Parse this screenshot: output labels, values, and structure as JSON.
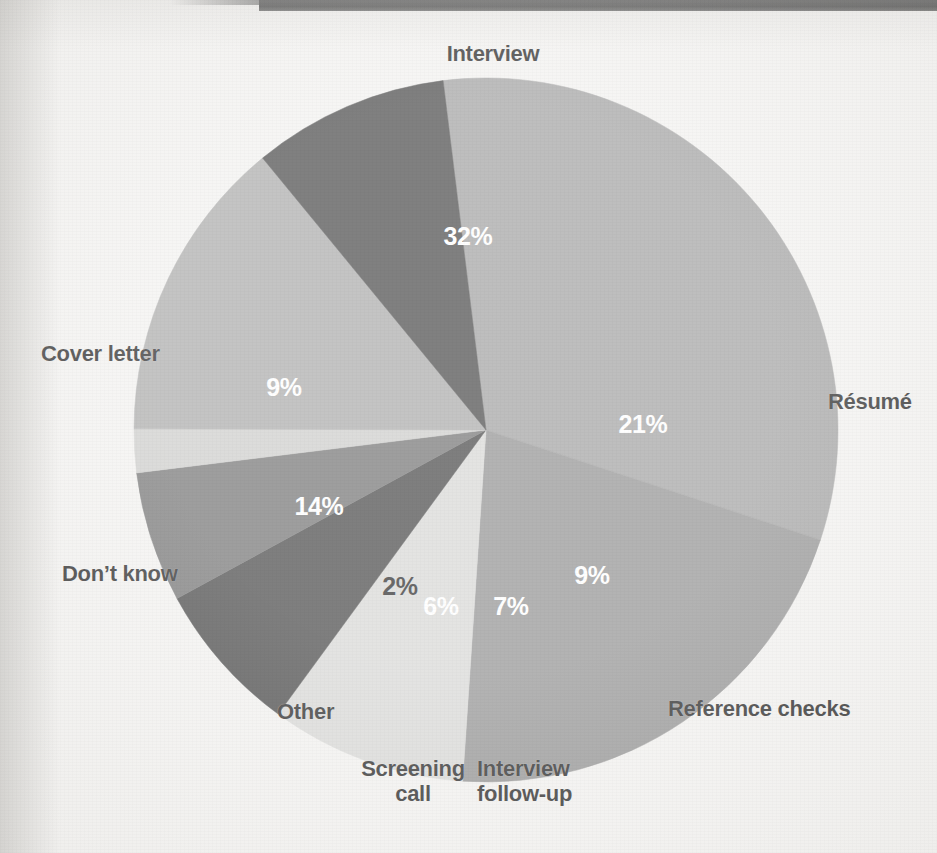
{
  "page": {
    "background_color": "#f2f1ef",
    "top_bar_color": "#434343"
  },
  "chart_data": {
    "type": "pie",
    "title": "",
    "subtitle": "",
    "xlabel": "",
    "ylabel": "",
    "legend_position": "none",
    "grid": false,
    "units": "percent",
    "total": 100,
    "start_angle_deg": -7,
    "direction": "clockwise",
    "categories": [
      "Interview",
      "Résumé",
      "Reference checks",
      "Interview follow-up",
      "Screening call",
      "Other",
      "Don't know",
      "Cover letter"
    ],
    "values": [
      32,
      21,
      9,
      7,
      6,
      2,
      14,
      9
    ],
    "value_labels": [
      "32%",
      "21%",
      "9%",
      "7%",
      "6%",
      "2%",
      "14%",
      "9%"
    ],
    "colors": [
      "#9b9b9b",
      "#8b8b8b",
      "#d5d5d3",
      "#3a3a3a",
      "#6a6a6a",
      "#c9c9c7",
      "#a5a5a4",
      "#3c3c3c"
    ],
    "label_text_colors": [
      "#ffffff",
      "#ffffff",
      "#ffffff",
      "#ffffff",
      "#ffffff",
      "#1a1a1a",
      "#ffffff",
      "#ffffff"
    ],
    "slices": [
      {
        "name": "Interview",
        "value": 32,
        "label": "32%",
        "color": "#9b9b9b",
        "text_color": "#ffffff",
        "label_x": 468,
        "label_y": 238,
        "anchor": "middle"
      },
      {
        "name": "Résumé",
        "value": 21,
        "label": "21%",
        "color": "#8b8b8b",
        "text_color": "#ffffff",
        "label_x": 643,
        "label_y": 426,
        "anchor": "middle"
      },
      {
        "name": "Reference checks",
        "value": 9,
        "label": "9%",
        "color": "#d5d5d3",
        "text_color": "#ffffff",
        "label_x": 592,
        "label_y": 577,
        "anchor": "middle"
      },
      {
        "name": "Interview follow-up",
        "value": 7,
        "label": "7%",
        "color": "#3a3a3a",
        "text_color": "#ffffff",
        "label_x": 511,
        "label_y": 608,
        "anchor": "middle"
      },
      {
        "name": "Screening call",
        "value": 6,
        "label": "6%",
        "color": "#6a6a6a",
        "text_color": "#ffffff",
        "label_x": 441,
        "label_y": 608,
        "anchor": "middle"
      },
      {
        "name": "Other",
        "value": 2,
        "label": "2%",
        "color": "#c9c9c7",
        "text_color": "#1a1a1a",
        "label_x": 400,
        "label_y": 588,
        "anchor": "middle"
      },
      {
        "name": "Don't know",
        "value": 14,
        "label": "14%",
        "color": "#a5a5a4",
        "text_color": "#ffffff",
        "label_x": 319,
        "label_y": 508,
        "anchor": "middle"
      },
      {
        "name": "Cover letter",
        "value": 9,
        "label": "9%",
        "color": "#3c3c3c",
        "text_color": "#ffffff",
        "label_x": 284,
        "label_y": 389,
        "anchor": "middle"
      }
    ],
    "category_labels": [
      {
        "name": "Interview",
        "text": "Interview",
        "x": 418,
        "y": 42,
        "align": "center",
        "width": 150
      },
      {
        "name": "Résumé",
        "text": "Résumé",
        "x": 828,
        "y": 390,
        "align": "left",
        "width": 110
      },
      {
        "name": "Reference checks",
        "text": "Reference checks",
        "x": 668,
        "y": 697,
        "align": "left",
        "width": 230
      },
      {
        "name": "Interview follow-up",
        "text": "Interview\nfollow-up",
        "x": 477,
        "y": 757,
        "align": "left",
        "width": 150
      },
      {
        "name": "Screening call",
        "text": "Screening\ncall",
        "x": 343,
        "y": 757,
        "align": "center",
        "width": 140
      },
      {
        "name": "Other",
        "text": "Other",
        "x": 277,
        "y": 700,
        "align": "left",
        "width": 100
      },
      {
        "name": "Don't know",
        "text": "Don’t know",
        "x": 62,
        "y": 562,
        "align": "left",
        "width": 160
      },
      {
        "name": "Cover letter",
        "text": "Cover letter",
        "x": 41,
        "y": 342,
        "align": "left",
        "width": 170
      }
    ],
    "geometry": {
      "center_x": 486,
      "center_y": 430,
      "radius": 352
    }
  }
}
